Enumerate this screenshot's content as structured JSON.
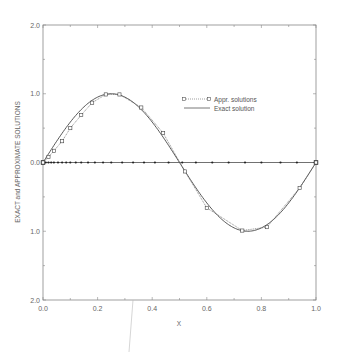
{
  "chart_data": {
    "type": "line",
    "title": "",
    "xlabel": "X",
    "ylabel": "EXACT and APPROXIMATE SOLUTIONS",
    "xlim": [
      0.0,
      1.0
    ],
    "ylim": [
      -2.0,
      2.0
    ],
    "x_ticks": [
      "0.0",
      "0.2",
      "0.4",
      "0.6",
      "0.8",
      "1.0"
    ],
    "y_ticks": [
      "2.0",
      "1.0",
      "0.0",
      "1.0",
      "2.0"
    ],
    "y_tick_values": [
      2.0,
      1.0,
      0.0,
      -1.0,
      -2.0
    ],
    "grid": false,
    "legend_position": "upper right (inside)",
    "series": [
      {
        "name": "Appr. solutions",
        "style": "dotted line with square markers",
        "x": [
          0.0,
          0.02,
          0.04,
          0.07,
          0.1,
          0.14,
          0.18,
          0.23,
          0.28,
          0.36,
          0.44,
          0.52,
          0.6,
          0.73,
          0.82,
          0.94,
          1.0
        ],
        "y": [
          0.0,
          0.08,
          0.17,
          0.31,
          0.5,
          0.69,
          0.87,
          0.99,
          0.99,
          0.8,
          0.43,
          -0.13,
          -0.66,
          -0.99,
          -0.94,
          -0.37,
          0.0
        ]
      },
      {
        "name": "Exact solution",
        "style": "solid line",
        "function": "sin(2*pi*x)"
      },
      {
        "name": "zero-line nodes",
        "style": "small filled dots on y=0",
        "x": [
          0.0,
          0.01,
          0.02,
          0.03,
          0.04,
          0.055,
          0.07,
          0.085,
          0.1,
          0.12,
          0.14,
          0.165,
          0.19,
          0.22,
          0.25,
          0.29,
          0.33,
          0.37,
          0.41,
          0.46,
          0.51,
          0.56,
          0.62,
          0.68,
          0.74,
          0.8,
          0.87,
          0.93,
          1.0
        ],
        "y": [
          0,
          0,
          0,
          0,
          0,
          0,
          0,
          0,
          0,
          0,
          0,
          0,
          0,
          0,
          0,
          0,
          0,
          0,
          0,
          0,
          0,
          0,
          0,
          0,
          0,
          0,
          0,
          0,
          0
        ]
      }
    ]
  },
  "legend": {
    "approx_label": "Appr. solutions",
    "exact_label": "Exact solution"
  }
}
